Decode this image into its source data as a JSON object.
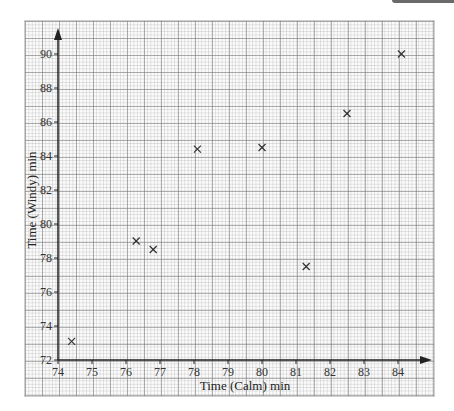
{
  "chart_data": {
    "type": "scatter",
    "title": "",
    "xlabel": "Time (Calm) min",
    "ylabel": "Time (Windy) min",
    "xlim": [
      74,
      84.6
    ],
    "ylim": [
      72,
      91
    ],
    "x_ticks": [
      74,
      75,
      76,
      77,
      78,
      79,
      80,
      81,
      82,
      83,
      84
    ],
    "y_ticks": [
      72,
      74,
      76,
      78,
      80,
      82,
      84,
      86,
      88,
      90
    ],
    "grid": true,
    "marker": "x",
    "legend": null,
    "points": [
      {
        "x": 74.4,
        "y": 73.1
      },
      {
        "x": 76.3,
        "y": 79.0
      },
      {
        "x": 76.8,
        "y": 78.5
      },
      {
        "x": 78.1,
        "y": 84.4
      },
      {
        "x": 80.0,
        "y": 84.5
      },
      {
        "x": 81.3,
        "y": 77.5
      },
      {
        "x": 82.5,
        "y": 86.5
      },
      {
        "x": 84.1,
        "y": 90.0
      }
    ]
  },
  "style": {
    "axis_color": "#222222",
    "marker_color": "#333333",
    "grid_major": "#9a9a9a",
    "grid_minor": "#cccccc"
  }
}
